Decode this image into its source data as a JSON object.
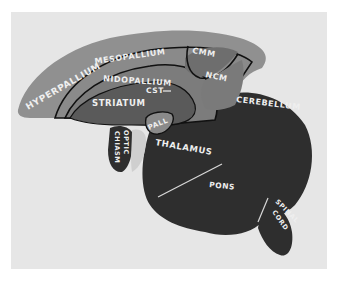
{
  "figure": {
    "colors": {
      "background": "#ffffff",
      "panel": "#e6e6e6",
      "hyperpallium": "#8f8f8f",
      "mesopallium": "#8a8a8a",
      "nidopallium": "#7c7c7c",
      "striatum": "#5a5a5a",
      "cmm": "#6e6e6e",
      "ncm": "#7a7a7a",
      "hindbrain": "#2e2e2e",
      "outline": "#111111",
      "label_text": "#efefef"
    },
    "labels": {
      "hyperpallium": "HYPERPALLIUM",
      "mesopallium": "MESOPALLIUM",
      "nidopallium": "NIDOPALLIUM",
      "cmm": "CMM",
      "ncm": "NCM",
      "cst": "CST",
      "striatum": "STRIATUM",
      "pall": "PALL",
      "optic_chiasm_1": "OPTIC",
      "optic_chiasm_2": "CHIASM",
      "thalamus": "THALAMUS",
      "cerebellum": "CEREBELLUM",
      "pons": "PONS",
      "spinal_cord_1": "SPINAL",
      "spinal_cord_2": "CORD"
    }
  }
}
